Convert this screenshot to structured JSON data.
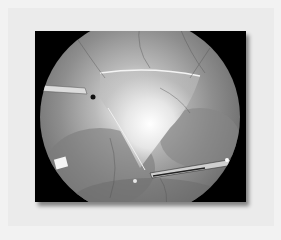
{
  "image": {
    "description": "Grayscale laparoscopic view inside circular scope field, framed in black with drop shadow on light gray background",
    "colors": {
      "background": "#ebebeb",
      "frame": "#000000",
      "highlight": "#ffffff"
    }
  }
}
